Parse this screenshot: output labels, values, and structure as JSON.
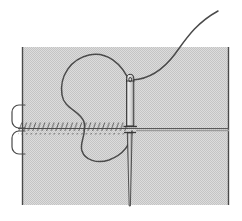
{
  "figure": {
    "title": "Suture needle and thread passing through tissue cross-section",
    "domain_kind": "technical-line-drawing",
    "canvas": {
      "width": 242,
      "height": 221,
      "background": "#ffffff"
    },
    "colors": {
      "tissue_fill": "#c9c9c9",
      "tissue_dither_light": "#e2e2e2",
      "line_stroke": "#3c3c3c",
      "thread_stroke": "#4a4a4a",
      "needle_fill": "#d8d8d8",
      "needle_stroke": "#333333",
      "background": "#ffffff"
    },
    "parts": {
      "tissue_block": {
        "label": "tissue-block",
        "x": 22,
        "y": 47,
        "width": 207,
        "height": 158,
        "fill": "#c9c9c9",
        "pattern": "dither-checker"
      },
      "left_border": {
        "label": "tissue-left-edge",
        "x": 22,
        "y1": 47,
        "y2": 205
      },
      "right_border": {
        "label": "tissue-right-edge",
        "x": 229,
        "y1": 47,
        "y2": 205
      },
      "seam_line": {
        "label": "horizontal-seam-line",
        "y": 128,
        "x1": 22,
        "x2": 229,
        "stitch_start_x": 20,
        "stitch_end_x": 128,
        "stitch_count": 24,
        "stitch_len": 9,
        "stitch_slant": 4
      },
      "left_flap_upper": {
        "label": "upper-tissue-flap",
        "x": 12,
        "y": 105,
        "width": 14,
        "height": 23,
        "radius": 7
      },
      "left_flap_lower": {
        "label": "lower-tissue-flap",
        "x": 12,
        "y": 130,
        "width": 14,
        "height": 23,
        "radius": 7
      },
      "needle_shaft_upper": {
        "label": "needle-body-above-seam",
        "x": 127,
        "y_top": 75,
        "y_bottom": 126,
        "width": 6
      },
      "needle_eye": {
        "label": "needle-eye",
        "cx": 130,
        "cy": 79,
        "rx": 3,
        "ry": 5
      },
      "needle_collar": {
        "label": "needle-collar",
        "x1": 124,
        "x2": 136,
        "y": 127
      },
      "needle_shaft_lower": {
        "label": "needle-body-below-seam",
        "x": 128.5,
        "y_top": 132,
        "y_bottom": 206,
        "width_top": 4,
        "width_tip": 1.2
      },
      "thread_loop": {
        "label": "thread-loop",
        "path_hint": "kidney-shaped loop left of needle crossing the seam",
        "d": "M129,81 C120,62 104,52 88,56 C70,61 60,78 63,95 C66,110 82,112 84,122 C86,133 80,142 82,150 C84,159 96,163 107,160 C121,156 131,145 132,132"
      },
      "thread_tail": {
        "label": "thread-tail-to-upper-right",
        "path_hint": "S-curve from needle eye to upper-right corner",
        "d": "M133,80 C152,78 164,68 176,52 C187,37 196,22 219,11"
      }
    }
  }
}
